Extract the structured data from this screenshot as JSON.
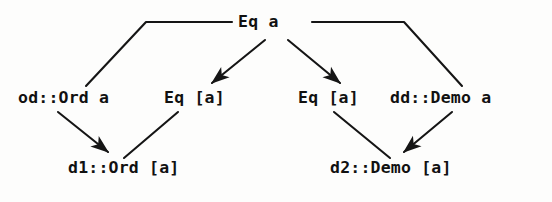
{
  "diagram": {
    "stroke_color": "#151515",
    "background_color": "#fdfdfc",
    "nodes": {
      "root": "Eq a",
      "od_ord_a": "od::Ord a",
      "eq_list_a_left": "Eq [a]",
      "eq_list_a_right": "Eq [a]",
      "dd_demo_a": "dd::Demo a",
      "d1_ord_list_a": "d1::Ord [a]",
      "d2_demo_list_a": "d2::Demo [a]"
    },
    "edges": [
      {
        "name": "root-to-od-ord-a",
        "from": "Eq a",
        "to": "od::Ord a",
        "style": "elbow",
        "arrowhead": false
      },
      {
        "name": "root-to-eq-list-a-left",
        "from": "Eq a",
        "to": "Eq [a]",
        "style": "diagonal",
        "arrowhead": true
      },
      {
        "name": "root-to-eq-list-a-right",
        "from": "Eq a",
        "to": "Eq [a]",
        "style": "diagonal",
        "arrowhead": true
      },
      {
        "name": "root-to-dd-demo-a",
        "from": "Eq a",
        "to": "dd::Demo a",
        "style": "elbow",
        "arrowhead": false
      },
      {
        "name": "od-ord-a-to-d1-ord-list-a",
        "from": "od::Ord a",
        "to": "d1::Ord [a]",
        "style": "diagonal",
        "arrowhead": true
      },
      {
        "name": "eq-list-a-left-to-d1",
        "from": "Eq [a]",
        "to": "d1::Ord [a]",
        "style": "diagonal",
        "arrowhead": false
      },
      {
        "name": "eq-list-a-right-to-d2",
        "from": "Eq [a]",
        "to": "d2::Demo [a]",
        "style": "diagonal",
        "arrowhead": false
      },
      {
        "name": "dd-demo-a-to-d2",
        "from": "dd::Demo a",
        "to": "d2::Demo [a]",
        "style": "diagonal",
        "arrowhead": true
      }
    ]
  }
}
